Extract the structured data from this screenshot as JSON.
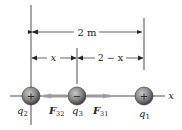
{
  "diagram": {
    "dimensions": {
      "total": "2 m",
      "left": "x",
      "right": "2 − x"
    },
    "axis_label": "x",
    "charges": [
      {
        "name": "q",
        "sub": "2",
        "sign": "+",
        "cx": 31
      },
      {
        "name": "q",
        "sub": "3",
        "sign": "−",
        "cx": 77
      },
      {
        "name": "q",
        "sub": "1",
        "sign": "+",
        "cx": 144
      }
    ],
    "forces": [
      {
        "name": "F",
        "sub": "32",
        "direction": "left"
      },
      {
        "name": "F",
        "sub": "31",
        "direction": "right"
      }
    ],
    "colors": {
      "sphere": "#8a8a8a",
      "sphere_dark": "#4a4a4a",
      "force_arrow": "#9a9a9a",
      "line": "#222222"
    }
  }
}
